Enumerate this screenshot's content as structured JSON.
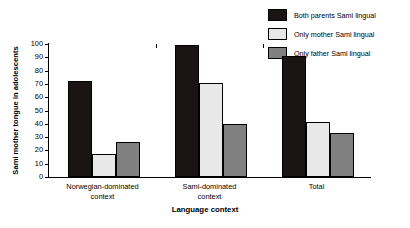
{
  "chart_data": {
    "type": "bar",
    "title": "",
    "xlabel": "Language context",
    "ylabel": "Sami mother tongue in adolescents",
    "categories": [
      "Norwegian-dominated\ncontext",
      "Sami-dominated\ncontext",
      "Total"
    ],
    "series": [
      {
        "name": "Both parents Sami lingual",
        "color": "#1a1414",
        "values": [
          72,
          99,
          91
        ]
      },
      {
        "name": "Only mother Sami lingual",
        "color": "#e8e8e8",
        "values": [
          17,
          71,
          41
        ]
      },
      {
        "name": "Only father Sami lingual",
        "color": "#808080",
        "values": [
          26,
          40,
          33
        ]
      }
    ],
    "ylim": [
      0,
      100
    ],
    "ytick_step": 10,
    "yticks": [
      0,
      10,
      20,
      30,
      40,
      50,
      60,
      70,
      80,
      90,
      100
    ],
    "grid": false,
    "legend_position": "top-right"
  },
  "legend": {
    "items": [
      {
        "label": "Both parents Sami lingual",
        "color": "#1a1414"
      },
      {
        "label": "Only mother Sami lingual",
        "color": "#e8e8e8"
      },
      {
        "label": "Only father Sami lingual",
        "color": "#808080"
      }
    ]
  },
  "axes": {
    "y_title": "Sami mother tongue in adolescents",
    "x_title": "Language context",
    "y_tick_labels": [
      "100",
      "90",
      "80",
      "70",
      "60",
      "50",
      "40",
      "30",
      "20",
      "10",
      "0"
    ],
    "x_tick_labels": [
      "Norwegian-dominated\ncontext",
      "Sami-dominated\ncontext",
      "Total"
    ]
  }
}
